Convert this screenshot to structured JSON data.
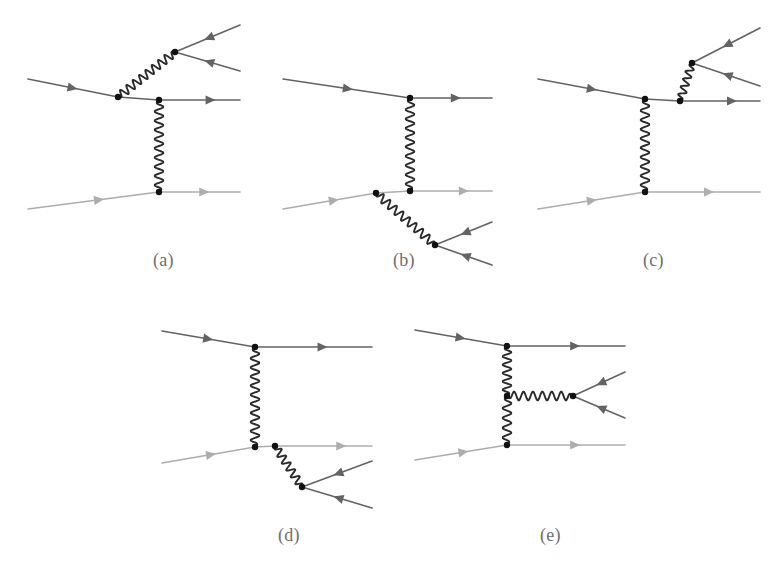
{
  "figure": {
    "background_color": "#ffffff",
    "colors": {
      "dark_fermion": "#636363",
      "light_fermion": "#adadad",
      "photon": "#2b2b2b",
      "vertex_dot": "#111111",
      "label_text": "#6e6e6e"
    },
    "line_widths": {
      "fermion": 1.6,
      "photon": 1.9
    },
    "vertex_radius": 3.2
  },
  "panels": [
    {
      "id": "a",
      "label": "(a)",
      "label_x": 153,
      "label_y": 250,
      "description": "Photon emitted from incoming upper fermion line converts to a lepton pair; t-channel photon exchange with lower line."
    },
    {
      "id": "b",
      "label": "(b)",
      "label_x": 393,
      "label_y": 250,
      "description": "Photon emitted from incoming lower fermion line converts to a lepton pair; t-channel photon exchange with upper line."
    },
    {
      "id": "c",
      "label": "(c)",
      "label_x": 643,
      "label_y": 250,
      "description": "Photon emitted from outgoing upper fermion line converts to a lepton pair; t-channel photon exchange."
    },
    {
      "id": "d",
      "label": "(d)",
      "label_x": 278,
      "label_y": 525,
      "description": "Photon emitted from outgoing lower fermion line converts to a lepton pair; t-channel photon exchange."
    },
    {
      "id": "e",
      "label": "(e)",
      "label_x": 540,
      "label_y": 525,
      "description": "Internal conversion: the exchanged photon radiates a second photon which converts into a lepton pair."
    }
  ],
  "geometry": {
    "a": {
      "fermion_lines": [
        {
          "name": "incoming-upper-fermion",
          "shade": "dark",
          "points": [
            [
              28,
              79
            ],
            [
              118,
              97
            ]
          ],
          "arrow_at": 0.55
        },
        {
          "name": "outgoing-upper-fermion",
          "shade": "dark",
          "points": [
            [
              118,
              97
            ],
            [
              159,
              100
            ],
            [
              240,
              100
            ]
          ],
          "arrow_at": 0.8
        },
        {
          "name": "incoming-lower-fermion",
          "shade": "light",
          "points": [
            [
              28,
              209
            ],
            [
              159,
              192
            ]
          ],
          "arrow_at": 0.58
        },
        {
          "name": "outgoing-lower-fermion",
          "shade": "light",
          "points": [
            [
              159,
              192
            ],
            [
              240,
              192
            ]
          ],
          "arrow_at": 0.62
        },
        {
          "name": "pair-lepton-upper",
          "shade": "dark",
          "points": [
            [
              175,
              52
            ],
            [
              240,
              25
            ]
          ],
          "arrow_at": 0.45,
          "arrow_reverse": true
        },
        {
          "name": "pair-lepton-lower",
          "shade": "dark",
          "points": [
            [
              175,
              52
            ],
            [
              240,
              71
            ]
          ],
          "arrow_at": 0.45,
          "arrow_reverse": true
        }
      ],
      "photons": [
        {
          "name": "emitted-photon",
          "from": [
            118,
            97
          ],
          "to": [
            175,
            52
          ],
          "amplitude": 4.2,
          "wavelength": 8.5
        },
        {
          "name": "exchange-photon",
          "from": [
            159,
            100
          ],
          "to": [
            159,
            192
          ],
          "amplitude": 4.4,
          "wavelength": 9.0
        }
      ],
      "vertices": [
        [
          118,
          97
        ],
        [
          159,
          100
        ],
        [
          159,
          192
        ],
        [
          175,
          52
        ]
      ]
    },
    "b": {
      "fermion_lines": [
        {
          "name": "incoming-upper-fermion",
          "shade": "dark",
          "points": [
            [
              283,
              79
            ],
            [
              410,
              98
            ]
          ],
          "arrow_at": 0.55
        },
        {
          "name": "outgoing-upper-fermion",
          "shade": "dark",
          "points": [
            [
              410,
              98
            ],
            [
              492,
              98
            ]
          ],
          "arrow_at": 0.62
        },
        {
          "name": "incoming-lower-fermion",
          "shade": "light",
          "points": [
            [
              283,
              209
            ],
            [
              376,
              193
            ]
          ],
          "arrow_at": 0.6
        },
        {
          "name": "outgoing-lower-fermion",
          "shade": "light",
          "points": [
            [
              376,
              193
            ],
            [
              410,
              191
            ],
            [
              492,
              191
            ]
          ],
          "arrow_at": 0.8
        },
        {
          "name": "pair-lepton-upper",
          "shade": "dark",
          "points": [
            [
              435,
              245
            ],
            [
              492,
              222
            ]
          ],
          "arrow_at": 0.45,
          "arrow_reverse": true
        },
        {
          "name": "pair-lepton-lower",
          "shade": "dark",
          "points": [
            [
              435,
              245
            ],
            [
              492,
              265
            ]
          ],
          "arrow_at": 0.45,
          "arrow_reverse": true
        }
      ],
      "photons": [
        {
          "name": "emitted-photon",
          "from": [
            376,
            193
          ],
          "to": [
            435,
            245
          ],
          "amplitude": 4.2,
          "wavelength": 8.5
        },
        {
          "name": "exchange-photon",
          "from": [
            410,
            98
          ],
          "to": [
            410,
            191
          ],
          "amplitude": 4.4,
          "wavelength": 9.0
        }
      ],
      "vertices": [
        [
          410,
          98
        ],
        [
          410,
          191
        ],
        [
          376,
          193
        ],
        [
          435,
          245
        ]
      ]
    },
    "c": {
      "fermion_lines": [
        {
          "name": "incoming-upper-fermion",
          "shade": "dark",
          "points": [
            [
              538,
              79
            ],
            [
              645,
              99
            ]
          ],
          "arrow_at": 0.55
        },
        {
          "name": "outgoing-upper-fermion",
          "shade": "dark",
          "points": [
            [
              645,
              99
            ],
            [
              680,
              101
            ],
            [
              760,
              101
            ]
          ],
          "arrow_at": 0.8
        },
        {
          "name": "incoming-lower-fermion",
          "shade": "light",
          "points": [
            [
              538,
              209
            ],
            [
              645,
              192
            ]
          ],
          "arrow_at": 0.55
        },
        {
          "name": "outgoing-lower-fermion",
          "shade": "light",
          "points": [
            [
              645,
              192
            ],
            [
              760,
              192
            ]
          ],
          "arrow_at": 0.6
        },
        {
          "name": "pair-lepton-upper",
          "shade": "dark",
          "points": [
            [
              692,
              63
            ],
            [
              760,
              28
            ]
          ],
          "arrow_at": 0.45,
          "arrow_reverse": true
        },
        {
          "name": "pair-lepton-lower",
          "shade": "dark",
          "points": [
            [
              692,
              63
            ],
            [
              760,
              86
            ]
          ],
          "arrow_at": 0.45,
          "arrow_reverse": true
        }
      ],
      "photons": [
        {
          "name": "emitted-photon",
          "from": [
            680,
            101
          ],
          "to": [
            692,
            63
          ],
          "amplitude": 3.8,
          "wavelength": 8.0
        },
        {
          "name": "exchange-photon",
          "from": [
            645,
            99
          ],
          "to": [
            645,
            192
          ],
          "amplitude": 4.4,
          "wavelength": 9.0
        }
      ],
      "vertices": [
        [
          645,
          99
        ],
        [
          645,
          192
        ],
        [
          680,
          101
        ],
        [
          692,
          63
        ]
      ]
    },
    "d": {
      "fermion_lines": [
        {
          "name": "incoming-upper-fermion",
          "shade": "dark",
          "points": [
            [
              162,
              331
            ],
            [
              255,
              347
            ]
          ],
          "arrow_at": 0.55
        },
        {
          "name": "outgoing-upper-fermion",
          "shade": "dark",
          "points": [
            [
              255,
              347
            ],
            [
              372,
              347
            ]
          ],
          "arrow_at": 0.62
        },
        {
          "name": "incoming-lower-fermion",
          "shade": "light",
          "points": [
            [
              162,
              463
            ],
            [
              255,
              447
            ]
          ],
          "arrow_at": 0.58
        },
        {
          "name": "outgoing-lower-fermion",
          "shade": "light",
          "points": [
            [
              255,
              447
            ],
            [
              275,
              446
            ],
            [
              372,
              446
            ]
          ],
          "arrow_at": 0.78
        },
        {
          "name": "pair-lepton-upper",
          "shade": "dark",
          "points": [
            [
              302,
              487
            ],
            [
              372,
              461
            ]
          ],
          "arrow_at": 0.45,
          "arrow_reverse": true
        },
        {
          "name": "pair-lepton-lower",
          "shade": "dark",
          "points": [
            [
              302,
              487
            ],
            [
              372,
              508
            ]
          ],
          "arrow_at": 0.45,
          "arrow_reverse": true
        }
      ],
      "photons": [
        {
          "name": "emitted-photon",
          "from": [
            275,
            446
          ],
          "to": [
            302,
            487
          ],
          "amplitude": 4.0,
          "wavelength": 8.5
        },
        {
          "name": "exchange-photon",
          "from": [
            255,
            347
          ],
          "to": [
            255,
            447
          ],
          "amplitude": 4.4,
          "wavelength": 9.0
        }
      ],
      "vertices": [
        [
          255,
          347
        ],
        [
          255,
          447
        ],
        [
          275,
          446
        ],
        [
          302,
          487
        ]
      ]
    },
    "e": {
      "fermion_lines": [
        {
          "name": "incoming-upper-fermion",
          "shade": "dark",
          "points": [
            [
              415,
              330
            ],
            [
              507,
              346
            ]
          ],
          "arrow_at": 0.55
        },
        {
          "name": "outgoing-upper-fermion",
          "shade": "dark",
          "points": [
            [
              507,
              346
            ],
            [
              625,
              346
            ]
          ],
          "arrow_at": 0.62
        },
        {
          "name": "incoming-lower-fermion",
          "shade": "light",
          "points": [
            [
              415,
              460
            ],
            [
              507,
              445
            ]
          ],
          "arrow_at": 0.58
        },
        {
          "name": "outgoing-lower-fermion",
          "shade": "light",
          "points": [
            [
              507,
              445
            ],
            [
              625,
              445
            ]
          ],
          "arrow_at": 0.62
        },
        {
          "name": "pair-lepton-upper",
          "shade": "dark",
          "points": [
            [
              573,
              396
            ],
            [
              625,
              372
            ]
          ],
          "arrow_at": 0.45,
          "arrow_reverse": true
        },
        {
          "name": "pair-lepton-lower",
          "shade": "dark",
          "points": [
            [
              573,
              396
            ],
            [
              625,
              418
            ]
          ],
          "arrow_at": 0.45,
          "arrow_reverse": true
        }
      ],
      "photons": [
        {
          "name": "exchange-photon-upper",
          "from": [
            507,
            346
          ],
          "to": [
            507,
            396
          ],
          "amplitude": 4.4,
          "wavelength": 9.0
        },
        {
          "name": "exchange-photon-lower",
          "from": [
            507,
            396
          ],
          "to": [
            507,
            445
          ],
          "amplitude": 4.4,
          "wavelength": 9.0
        },
        {
          "name": "internal-conversion-photon",
          "from": [
            507,
            396
          ],
          "to": [
            573,
            396
          ],
          "amplitude": 4.4,
          "wavelength": 9.0
        }
      ],
      "vertices": [
        [
          507,
          346
        ],
        [
          507,
          445
        ],
        [
          507,
          396
        ],
        [
          573,
          396
        ]
      ]
    }
  }
}
